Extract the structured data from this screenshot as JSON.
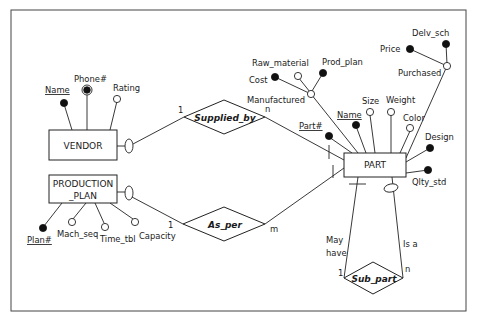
{
  "diagram": {
    "type": "ER diagram",
    "entities": [
      {
        "id": "vendor",
        "label": "VENDOR"
      },
      {
        "id": "production_plan",
        "label_line1": "PRODUCTION",
        "label_line2": "_PLAN"
      },
      {
        "id": "part",
        "label": "PART"
      }
    ],
    "relationships": [
      {
        "id": "supplied_by",
        "label": "Supplied_by",
        "card_vendor": "1",
        "card_part": "n"
      },
      {
        "id": "as_per",
        "label": "As_per",
        "card_plan": "1",
        "card_part": "m"
      },
      {
        "id": "sub_part",
        "label": "Sub_part",
        "card_left": "1",
        "card_right": "n",
        "role_left_line1": "May",
        "role_left_line2": "have",
        "role_right": "Is a"
      }
    ],
    "vendor_attrs": {
      "name": "Name",
      "phone": "Phone#",
      "rating": "Rating"
    },
    "plan_attrs": {
      "plan": "Plan#",
      "mach_seq": "Mach_seq",
      "time_tbl": "Time_tbl",
      "capacity": "Capacity"
    },
    "part_attrs": {
      "part_no": "Part#",
      "name": "Name",
      "size": "Size",
      "weight": "Weight",
      "color": "Color",
      "design": "Design",
      "qlty_std": "Qlty_std",
      "manufactured": "Manufactured",
      "cost": "Cost",
      "raw_material": "Raw_material",
      "prod_plan": "Prod_plan",
      "purchased": "Purchased",
      "price": "Price",
      "delv_sch": "Delv_sch"
    },
    "legend": {
      "key_attribute": "filled circle",
      "optional_attribute": "open circle",
      "multivalued_attribute": "double circle"
    }
  }
}
